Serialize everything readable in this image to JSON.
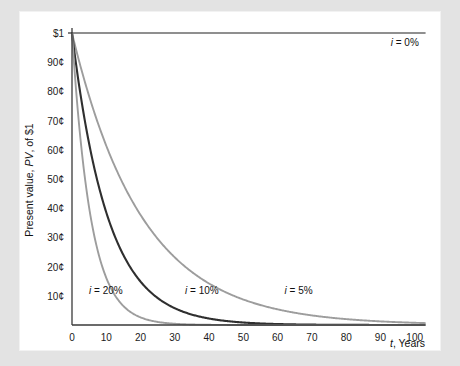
{
  "chart_data": {
    "type": "line",
    "title": "",
    "xlabel": "t, Years",
    "ylabel": "Present value, PV, of $1",
    "xlim": [
      0,
      103
    ],
    "ylim": [
      0,
      1.0
    ],
    "grid": false,
    "legend_position": "inline-annotations",
    "x_ticks": [
      {
        "value": 0,
        "label": "0"
      },
      {
        "value": 10,
        "label": "10"
      },
      {
        "value": 20,
        "label": "20"
      },
      {
        "value": 30,
        "label": "30"
      },
      {
        "value": 40,
        "label": "40"
      },
      {
        "value": 50,
        "label": "50"
      },
      {
        "value": 60,
        "label": "60"
      },
      {
        "value": 70,
        "label": "70"
      },
      {
        "value": 80,
        "label": "80"
      },
      {
        "value": 90,
        "label": "90"
      },
      {
        "value": 100,
        "label": "100"
      }
    ],
    "y_ticks": [
      {
        "value": 1.0,
        "label": "$1"
      },
      {
        "value": 0.9,
        "label": "90¢"
      },
      {
        "value": 0.8,
        "label": "80¢"
      },
      {
        "value": 0.7,
        "label": "70¢"
      },
      {
        "value": 0.6,
        "label": "60¢"
      },
      {
        "value": 0.5,
        "label": "50¢"
      },
      {
        "value": 0.4,
        "label": "40¢"
      },
      {
        "value": 0.3,
        "label": "30¢"
      },
      {
        "value": 0.2,
        "label": "20¢"
      },
      {
        "value": 0.1,
        "label": "10¢"
      },
      {
        "value": 0.0,
        "label": "0"
      }
    ],
    "x": [
      0,
      5,
      10,
      15,
      20,
      25,
      30,
      35,
      40,
      45,
      50,
      55,
      60,
      65,
      70,
      75,
      80,
      85,
      90,
      95,
      100
    ],
    "series": [
      {
        "name": "i = 0%",
        "rate": 0.0,
        "color": "#6b6b6b",
        "width": 1.6,
        "label": "i = 0%",
        "label_x": 93,
        "label_y": 0.955,
        "values": [
          1.0,
          1.0,
          1.0,
          1.0,
          1.0,
          1.0,
          1.0,
          1.0,
          1.0,
          1.0,
          1.0,
          1.0,
          1.0,
          1.0,
          1.0,
          1.0,
          1.0,
          1.0,
          1.0,
          1.0,
          1.0
        ]
      },
      {
        "name": "i = 5%",
        "rate": 0.05,
        "color": "#9d9d9d",
        "width": 1.9,
        "label": "i = 5%",
        "label_x": 62,
        "label_y": 0.105,
        "values": [
          1.0,
          0.784,
          0.614,
          0.481,
          0.377,
          0.295,
          0.231,
          0.181,
          0.142,
          0.111,
          0.087,
          0.068,
          0.054,
          0.042,
          0.033,
          0.026,
          0.02,
          0.016,
          0.012,
          0.01,
          0.008
        ]
      },
      {
        "name": "i = 10%",
        "rate": 0.1,
        "color": "#2f2f2f",
        "width": 2.1,
        "label": "i = 10%",
        "label_x": 33,
        "label_y": 0.105,
        "values": [
          1.0,
          0.621,
          0.386,
          0.239,
          0.149,
          0.092,
          0.057,
          0.036,
          0.022,
          0.014,
          0.0085,
          0.0053,
          0.0033,
          0.002,
          0.0013,
          0.0008,
          0.0005,
          0.0003,
          0.0002,
          0.0001,
          0.0001
        ]
      },
      {
        "name": "i = 20%",
        "rate": 0.2,
        "color": "#9d9d9d",
        "width": 1.9,
        "label": "i = 20%",
        "label_x": 5,
        "label_y": 0.105,
        "values": [
          1.0,
          0.402,
          0.162,
          0.065,
          0.026,
          0.01,
          0.004,
          0.0017,
          0.0007,
          0.0003,
          0.0001,
          4e-05,
          2e-05,
          1e-05,
          3e-06,
          1e-06,
          5e-07,
          2e-07,
          1e-07,
          4e-08,
          1e-08
        ]
      }
    ]
  },
  "axis": {
    "y_title_prefix": "Present value, ",
    "y_title_italic": "PV",
    "y_title_suffix": ", of $1",
    "x_title_italic": "t",
    "x_title_suffix": ", Years"
  }
}
